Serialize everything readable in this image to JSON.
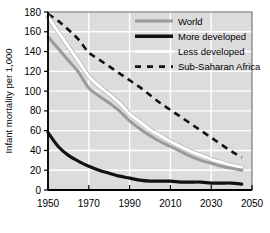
{
  "chart_data": {
    "type": "line",
    "title": "",
    "xlabel": "",
    "ylabel": "Infant mortality per 1,000",
    "xlim": [
      1950,
      2050
    ],
    "ylim": [
      0,
      180
    ],
    "xticks": [
      1950,
      1970,
      1990,
      2010,
      2030,
      2050
    ],
    "yticks": [
      0,
      20,
      40,
      60,
      80,
      100,
      120,
      140,
      160,
      180
    ],
    "grid": true,
    "legend_position": "top-right",
    "x": [
      1950,
      1955,
      1960,
      1965,
      1970,
      1975,
      1980,
      1985,
      1990,
      1995,
      2000,
      2005,
      2010,
      2015,
      2020,
      2025,
      2030,
      2035,
      2040,
      2045
    ],
    "series": [
      {
        "name": "World",
        "color": "#9a9a9a",
        "style": "solid",
        "values": [
          155,
          143,
          131,
          119,
          103,
          95,
          88,
          80,
          70,
          62,
          55,
          49,
          44,
          39,
          34,
          30,
          27,
          24,
          22,
          20
        ]
      },
      {
        "name": "More developed",
        "color": "#111111",
        "style": "solid",
        "values": [
          58,
          44,
          35,
          29,
          24,
          20,
          17,
          14,
          12,
          10,
          9,
          9,
          9,
          8,
          8,
          8,
          7,
          7,
          7,
          6
        ]
      },
      {
        "name": "Less developed",
        "color": "#ffffff",
        "style": "solid",
        "values": [
          175,
          160,
          145,
          130,
          115,
          105,
          97,
          88,
          77,
          69,
          61,
          55,
          49,
          44,
          39,
          35,
          31,
          28,
          25,
          23
        ]
      },
      {
        "name": "Sub-Saharan Africa",
        "color": "#111111",
        "style": "dashed",
        "values": [
          178,
          171,
          162,
          152,
          139,
          132,
          125,
          118,
          111,
          104,
          96,
          88,
          81,
          74,
          67,
          60,
          53,
          46,
          39,
          33
        ]
      }
    ]
  },
  "axis": {
    "y_title": "Infant mortality per 1,000",
    "y_tick_labels": [
      "0",
      "20",
      "40",
      "60",
      "80",
      "100",
      "120",
      "140",
      "160",
      "180"
    ],
    "x_tick_labels": [
      "1950",
      "1970",
      "1990",
      "2010",
      "2030",
      "2050"
    ]
  },
  "legend": {
    "entries": [
      {
        "label": "World",
        "swatch": "gray-solid-line"
      },
      {
        "label": "More developed",
        "swatch": "black-solid-line"
      },
      {
        "label": "Less developed",
        "swatch": "white-solid-line"
      },
      {
        "label": "Sub-Saharan Africa",
        "swatch": "black-dashed-line"
      }
    ]
  },
  "colors": {
    "plot_background": "#dcdcdc",
    "gridline": "#ffffff",
    "frame": "#5a5a5a",
    "world": "#9a9a9a",
    "more_developed": "#111111",
    "less_developed": "#ffffff",
    "sub_saharan_africa": "#111111"
  }
}
